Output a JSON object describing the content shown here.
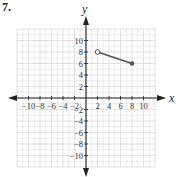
{
  "problem_label": "7.",
  "chart_data": {
    "type": "line",
    "title": "",
    "xlabel": "x",
    "ylabel": "y",
    "xlim": [
      -12,
      12
    ],
    "ylim": [
      -12,
      12
    ],
    "grid": true,
    "x_ticks": [
      -10,
      -8,
      -6,
      -4,
      -2,
      2,
      4,
      6,
      8,
      10
    ],
    "y_ticks": [
      10,
      8,
      6,
      4,
      2,
      -2,
      -4,
      -6,
      -8,
      -10
    ],
    "series": [
      {
        "name": "segment",
        "points": [
          {
            "x": 2,
            "y": 8,
            "marker": "open"
          },
          {
            "x": 8,
            "y": 6,
            "marker": "closed"
          }
        ]
      }
    ]
  },
  "colors": {
    "grid": "#d9d9d9",
    "axis": "#222222",
    "segment": "#555555"
  }
}
